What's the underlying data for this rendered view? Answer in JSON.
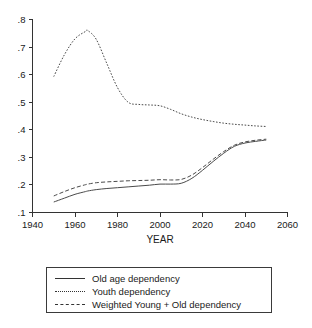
{
  "chart_data": {
    "type": "line",
    "title": "",
    "xlabel": "YEAR",
    "ylabel": "",
    "xlim": [
      1940,
      2060
    ],
    "ylim": [
      0.1,
      0.8
    ],
    "grid": false,
    "legend_position": "bottom",
    "x_ticks": [
      "1940",
      "1960",
      "1980",
      "2000",
      "2020",
      "2040",
      "2060"
    ],
    "x_tick_values": [
      1940,
      1960,
      1980,
      2000,
      2020,
      2040,
      2060
    ],
    "y_ticks": [
      ".1",
      ".2",
      ".3",
      ".4",
      ".5",
      ".6",
      ".7",
      ".8"
    ],
    "y_tick_values": [
      0.1,
      0.2,
      0.3,
      0.4,
      0.5,
      0.6,
      0.7,
      0.8
    ],
    "x": [
      1950,
      1955,
      1960,
      1965,
      1966,
      1970,
      1975,
      1980,
      1985,
      1990,
      1995,
      2000,
      2005,
      2010,
      2015,
      2020,
      2025,
      2030,
      2035,
      2040,
      2045,
      2050
    ],
    "series": [
      {
        "name": "Old age dependency",
        "style": "solid",
        "color": "#4a4a4a",
        "values": [
          0.138,
          0.152,
          0.166,
          0.176,
          0.178,
          0.183,
          0.187,
          0.19,
          0.193,
          0.196,
          0.199,
          0.203,
          0.203,
          0.206,
          0.224,
          0.253,
          0.285,
          0.315,
          0.34,
          0.352,
          0.358,
          0.363
        ]
      },
      {
        "name": "Youth dependency",
        "style": "dotted",
        "color": "#4a4a4a",
        "values": [
          0.593,
          0.672,
          0.73,
          0.757,
          0.76,
          0.728,
          0.64,
          0.553,
          0.5,
          0.492,
          0.49,
          0.487,
          0.474,
          0.458,
          0.446,
          0.437,
          0.43,
          0.424,
          0.42,
          0.417,
          0.414,
          0.412
        ]
      },
      {
        "name": "Weighted Young + Old dependency",
        "style": "dashed",
        "color": "#4a4a4a",
        "values": [
          0.16,
          0.176,
          0.19,
          0.201,
          0.203,
          0.208,
          0.211,
          0.213,
          0.215,
          0.216,
          0.217,
          0.219,
          0.218,
          0.22,
          0.236,
          0.263,
          0.293,
          0.321,
          0.344,
          0.356,
          0.362,
          0.366
        ]
      }
    ]
  },
  "legend": {
    "items": [
      {
        "label": "Old age dependency",
        "style": "solid"
      },
      {
        "label": "Youth dependency",
        "style": "dotted"
      },
      {
        "label": "Weighted Young + Old dependency",
        "style": "dashed"
      }
    ]
  }
}
